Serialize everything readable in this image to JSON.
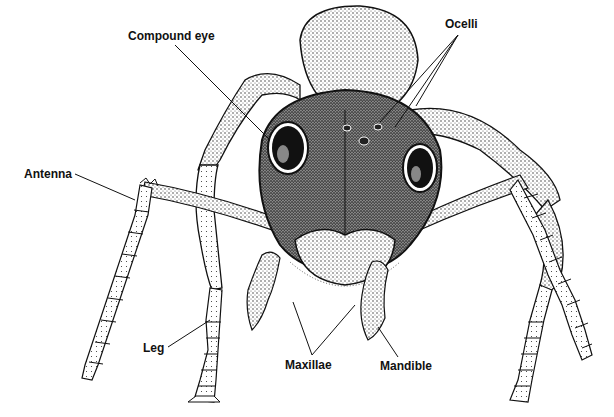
{
  "diagram": {
    "labels": {
      "compound_eye": "Compound eye",
      "ocelli": "Ocelli",
      "antenna": "Antenna",
      "leg": "Leg",
      "maxillae": "Maxillae",
      "mandible": "Mandible"
    },
    "colors": {
      "ink": "#111111",
      "background": "#ffffff"
    }
  }
}
